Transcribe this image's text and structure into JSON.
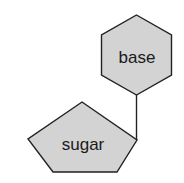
{
  "diagram": {
    "type": "nucleotide-schematic",
    "colors": {
      "fill": "#d3d3d3",
      "stroke": "#222222",
      "text": "#1a1a1a",
      "background": "#ffffff"
    },
    "nodes": [
      {
        "id": "base",
        "shape": "hexagon",
        "label": "base"
      },
      {
        "id": "sugar",
        "shape": "pentagon",
        "label": "sugar"
      }
    ],
    "edges": [
      {
        "from": "sugar",
        "to": "base"
      }
    ]
  }
}
